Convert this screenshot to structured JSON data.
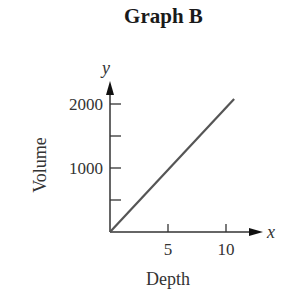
{
  "chart_data": {
    "type": "line",
    "title": "Graph B",
    "xlabel": "Depth",
    "ylabel": "Volume",
    "x_axis_symbol": "x",
    "y_axis_symbol": "y",
    "x_ticks": [
      5,
      10
    ],
    "x_tick_labels": [
      "5",
      "10"
    ],
    "y_ticks": [
      500,
      1000,
      1500,
      2000
    ],
    "y_tick_labels": [
      "",
      "1000",
      "",
      "2000"
    ],
    "xlim": [
      0,
      12.5
    ],
    "ylim": [
      0,
      2300
    ],
    "grid": false,
    "legend": null,
    "series": [
      {
        "name": "Volume vs Depth",
        "x": [
          0,
          10.7
        ],
        "y": [
          0,
          2080
        ],
        "color": "#555555"
      }
    ]
  }
}
